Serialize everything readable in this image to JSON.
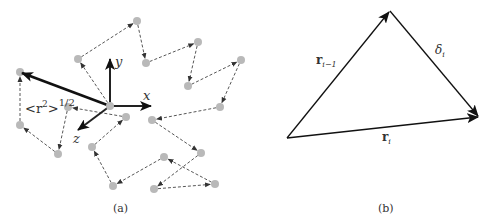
{
  "panel_a": {
    "caption": "(a)",
    "axes": {
      "x": "x",
      "y": "y",
      "z": "z"
    },
    "rms_label_base": "<r",
    "rms_label_sup2": "2",
    "rms_label_close": ">",
    "rms_label_exp": "1/2",
    "origin": [
      110,
      106
    ],
    "points": [
      [
        110,
        106
      ],
      [
        78,
        59
      ],
      [
        137,
        21
      ],
      [
        146,
        63
      ],
      [
        198,
        42
      ],
      [
        188,
        86
      ],
      [
        241,
        60
      ],
      [
        220,
        107
      ],
      [
        152,
        120
      ],
      [
        201,
        153
      ],
      [
        154,
        189
      ],
      [
        215,
        184
      ],
      [
        164,
        157
      ],
      [
        113,
        186
      ],
      [
        92,
        147
      ],
      [
        126,
        117
      ],
      [
        68,
        107
      ],
      [
        58,
        154
      ],
      [
        20,
        125
      ],
      [
        20,
        72
      ]
    ],
    "end_to_end_vector": {
      "from": [
        110,
        106
      ],
      "to": [
        20,
        72
      ]
    },
    "colors": {
      "points": "#b9b9b9",
      "dashed": "#444444",
      "vector": "#111111"
    }
  },
  "panel_b": {
    "caption": "(b)",
    "vectors": [
      {
        "name": "r_{i-1}",
        "label_main": "r",
        "label_sub": "i−1",
        "from": [
          287,
          138
        ],
        "to": [
          390,
          11
        ]
      },
      {
        "name": "delta_i",
        "label_main": "δ",
        "label_sub": "i",
        "from": [
          390,
          11
        ],
        "to": [
          479,
          117
        ]
      },
      {
        "name": "r_i",
        "label_main": "r",
        "label_sub": "i",
        "from": [
          287,
          138
        ],
        "to": [
          479,
          117
        ]
      }
    ]
  }
}
